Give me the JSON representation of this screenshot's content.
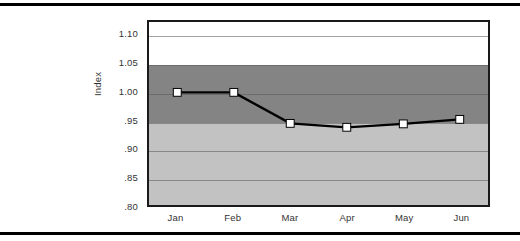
{
  "chart_data": {
    "type": "line",
    "title": "",
    "xlabel": "",
    "ylabel": "Index",
    "categories": [
      "Jan",
      "Feb",
      "Mar",
      "Apr",
      "May",
      "Jun"
    ],
    "values": [
      1.0,
      1.0,
      0.945,
      0.938,
      0.944,
      0.952
    ],
    "series": [
      {
        "name": "Index",
        "values": [
          1.0,
          1.0,
          0.945,
          0.938,
          0.944,
          0.952
        ]
      }
    ],
    "ylim": [
      0.8,
      1.125
    ],
    "ytick_labels": [
      "1.10",
      "1.05",
      "1.00",
      ".95",
      ".90",
      ".85",
      ".80"
    ],
    "ytick_values": [
      1.1,
      1.05,
      1.0,
      0.95,
      0.9,
      0.85,
      0.8
    ],
    "xtick_labels": [
      "Jan",
      "Feb",
      "Mar",
      "Apr",
      "May",
      "Jun"
    ],
    "grid": true,
    "legend": "none",
    "marker": "square",
    "marker_face_color": "#ffffff",
    "marker_edge_color": "#000000",
    "line_color": "#000000",
    "bands": [
      {
        "name": "upper-white-band",
        "from": 1.05,
        "to": 1.125,
        "color": "#ffffff"
      },
      {
        "name": "mid-dark-band",
        "from": 0.95,
        "to": 1.05,
        "color": "#848484"
      },
      {
        "name": "lower-light-band",
        "from": 0.8,
        "to": 0.95,
        "color": "#c2c2c2"
      }
    ]
  },
  "figure": {
    "background_color": "#ffffff",
    "rule_color": "#000000",
    "axis_text_color": "#333333"
  }
}
